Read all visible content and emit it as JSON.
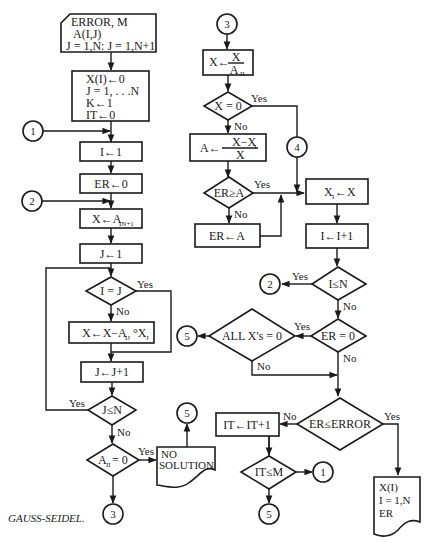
{
  "caption": "GAUSS-SEIDEL.",
  "input_card": {
    "line1": "ERROR, M",
    "line2": "A(I,J)",
    "line3": "J = 1,N: J = 1,N+1"
  },
  "init_box": {
    "line1": "X(I)←0",
    "line2": "J = 1, . . .N",
    "line3": "K←1",
    "line4": "IT←0"
  },
  "boxes": {
    "i_init": "I←1",
    "er_init": "ER←0",
    "x_assign": "X←A",
    "x_assign_sub": "IN+1",
    "j_init": "J←1",
    "x_update": "X←X−A",
    "x_update_sub1": "IJ",
    "x_update_mid": "°X",
    "x_update_sub2": "J",
    "j_inc": "J←J+1",
    "x_div_lhs": "X←",
    "x_div_num": "X",
    "x_div_den": "A",
    "x_div_den_sub": "II",
    "a_calc_lhs": "A←",
    "a_calc_num": "X−X",
    "a_calc_num_sub": "I",
    "a_calc_den": "X",
    "er_set": "ER←A",
    "xi_assign": "X",
    "xi_assign_sub": "I",
    "xi_assign_rhs": "←X",
    "i_inc": "I←I+1",
    "it_inc": "IT←IT+1"
  },
  "decisions": {
    "i_eq_j": "I = J",
    "j_le_n": "J≤N",
    "aii_zero": "A",
    "aii_zero_sub": "II",
    "aii_zero_rhs": " = 0",
    "x_zero": "X = 0",
    "er_ge_a": "ER≥A",
    "i_le_n": "I≤N",
    "er_zero": "ER = 0",
    "all_x_zero": "ALL X's = 0",
    "er_le_error": "ER≤ERROR",
    "it_le_m": "IT≤M"
  },
  "outputs": {
    "no_solution_line1": "NO",
    "no_solution_line2": "SOLUTION",
    "result_line1": "X(I)",
    "result_line2": "I = 1,N",
    "result_line3": "ER"
  },
  "connectors": {
    "c1_left": "1",
    "c2_left": "2",
    "c3_bottom": "3",
    "c5_nosol": "5",
    "c3_top": "3",
    "c4": "4",
    "c2_right": "2",
    "c5_allx": "5",
    "c1_itm": "1",
    "c5_itm": "5"
  },
  "labels": {
    "yes": "Yes",
    "no": "No"
  }
}
